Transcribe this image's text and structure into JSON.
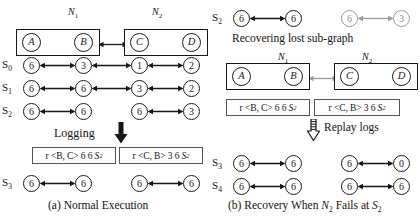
{
  "figure": {
    "panel_a": {
      "caption": "(a) Normal Execution",
      "partitions": [
        {
          "id": "N1",
          "label": "N",
          "sub": "1",
          "nodes": [
            "A",
            "B"
          ]
        },
        {
          "id": "N2",
          "label": "N",
          "sub": "2",
          "nodes": [
            "C",
            "D"
          ]
        }
      ],
      "logging_label": "Logging",
      "rows": [
        {
          "state": "S",
          "sub": "0",
          "values": [
            "6",
            "3",
            "1",
            "2"
          ],
          "split": false,
          "grey": [
            false,
            false,
            false,
            false
          ]
        },
        {
          "state": "S",
          "sub": "1",
          "values": [
            "6",
            "6",
            "3",
            "2"
          ],
          "split": false,
          "grey": [
            false,
            false,
            false,
            false
          ]
        },
        {
          "state": "S",
          "sub": "2",
          "values": [
            "6",
            "6",
            "6",
            "3"
          ],
          "split": true,
          "grey": [
            false,
            false,
            false,
            false
          ]
        },
        {
          "state": "S",
          "sub": "3",
          "values": [
            "6",
            "6",
            "6",
            "6"
          ],
          "split": true,
          "grey": [
            false,
            false,
            false,
            false
          ]
        }
      ],
      "logs": [
        {
          "prefix": "r",
          "pair": "<B, C>",
          "values": "6 6",
          "state": "S",
          "sub": "2"
        },
        {
          "prefix": "r",
          "pair": "<C, B>",
          "values": "3 6",
          "state": "S",
          "sub": "2"
        }
      ]
    },
    "panel_b": {
      "caption_parts": {
        "a": "(b) Recovery When ",
        "n": "N",
        "n_sub": "2",
        "b": " Fails at ",
        "s": "S",
        "s_sub": "2"
      },
      "recover_label": "Recovering lost sub-graph",
      "replay_label": "Replay logs",
      "partitions": [
        {
          "id": "N1",
          "label": "N",
          "sub": "1",
          "nodes": [
            "A",
            "B"
          ]
        },
        {
          "id": "N2",
          "label": "N",
          "sub": "2",
          "nodes": [
            "C",
            "D"
          ]
        }
      ],
      "rows": [
        {
          "state": "S",
          "sub": "2",
          "values": [
            "6",
            "6",
            "6",
            "3"
          ],
          "split": true,
          "grey": [
            false,
            false,
            true,
            true
          ]
        },
        {
          "state": "S",
          "sub": "3",
          "values": [
            "6",
            "6",
            "6",
            "0"
          ],
          "split": true,
          "grey": [
            false,
            false,
            false,
            false
          ]
        },
        {
          "state": "S",
          "sub": "4",
          "values": [
            "6",
            "6",
            "6",
            "6"
          ],
          "split": true,
          "grey": [
            false,
            false,
            false,
            false
          ]
        }
      ],
      "logs": [
        {
          "prefix": "r",
          "pair": "<B, C>",
          "values": "6 6",
          "state": "S",
          "sub": "2"
        },
        {
          "prefix": "r",
          "pair": "<C, B>",
          "values": "3 6",
          "state": "S",
          "sub": "2"
        }
      ]
    },
    "colors": {
      "ink": "#161616",
      "grey": "#9a9a9a",
      "background": "#ffffff"
    }
  }
}
